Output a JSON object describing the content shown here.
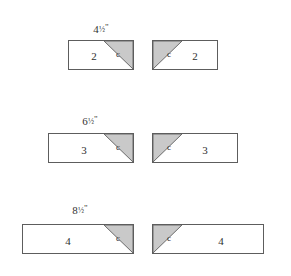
{
  "figure": {
    "background_color": "#ffffff",
    "outline_color": "#5d5d5d",
    "triangle_fill_color": "#c9c9c9",
    "triangle_edge_color": "#6a6a6a",
    "text_color": "#303030",
    "corner_label": "c"
  },
  "rows": [
    {
      "dimension": {
        "whole": "4",
        "fraction": "1/2",
        "unit": "\"",
        "full_text": "4½\"",
        "x": 101,
        "y": 22
      },
      "left_piece": {
        "number": "2",
        "corner": "c",
        "corner_position": "top-right",
        "x": 68,
        "y": 40,
        "width": 66,
        "height": 30,
        "triangle_leg": 29,
        "number_x": 25,
        "number_y": 15,
        "corner_x": 49,
        "corner_y": 13
      },
      "right_piece": {
        "number": "2",
        "corner": "c",
        "corner_position": "top-left",
        "x": 152,
        "y": 40,
        "width": 66,
        "height": 30,
        "triangle_leg": 29,
        "number_x": 42,
        "number_y": 15,
        "corner_x": 16,
        "corner_y": 13
      }
    },
    {
      "dimension": {
        "whole": "6",
        "fraction": "1/2",
        "unit": "\"",
        "full_text": "6½\"",
        "x": 90,
        "y": 114
      },
      "left_piece": {
        "number": "3",
        "corner": "c",
        "corner_position": "top-right",
        "x": 48,
        "y": 133,
        "width": 86,
        "height": 30,
        "triangle_leg": 29,
        "number_x": 35,
        "number_y": 16,
        "corner_x": 69,
        "corner_y": 13
      },
      "right_piece": {
        "number": "3",
        "corner": "c",
        "corner_position": "top-left",
        "x": 152,
        "y": 133,
        "width": 86,
        "height": 30,
        "triangle_leg": 29,
        "number_x": 52,
        "number_y": 16,
        "corner_x": 16,
        "corner_y": 13
      }
    },
    {
      "dimension": {
        "whole": "8",
        "fraction": "1/2",
        "unit": "\"",
        "full_text": "8½\"",
        "x": 80,
        "y": 203
      },
      "left_piece": {
        "number": "4",
        "corner": "c",
        "corner_position": "top-right",
        "x": 22,
        "y": 224,
        "width": 112,
        "height": 30,
        "triangle_leg": 29,
        "number_x": 45,
        "number_y": 16,
        "corner_x": 95,
        "corner_y": 13
      },
      "right_piece": {
        "number": "4",
        "corner": "c",
        "corner_position": "top-left",
        "x": 152,
        "y": 224,
        "width": 112,
        "height": 30,
        "triangle_leg": 29,
        "number_x": 68,
        "number_y": 16,
        "corner_x": 16,
        "corner_y": 13
      }
    }
  ]
}
